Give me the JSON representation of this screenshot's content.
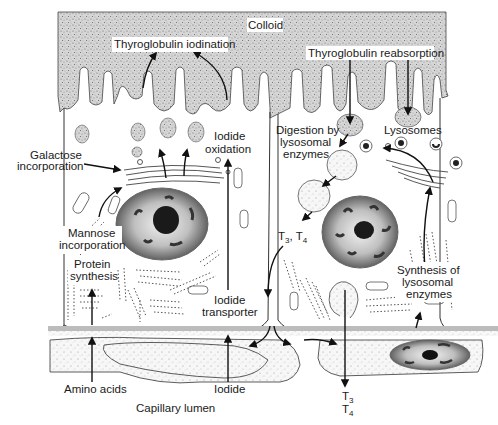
{
  "diagram": {
    "regions": {
      "colloid": "Colloid",
      "capillary": "Capillary lumen"
    },
    "left_cell_labels": {
      "thyroglobulin_iodination": "Thyroglobulin iodination",
      "iodide_oxidation_1": "Iodide",
      "iodide_oxidation_2": "oxidation",
      "galactose_1": "Galactose",
      "galactose_2": "incorporation",
      "mannose_1": "Mannose",
      "mannose_2": "incorporation",
      "protein_synthesis_1": "Protein",
      "protein_synthesis_2": "synthesis",
      "iodide_transporter_1": "Iodide",
      "iodide_transporter_2": "transporter",
      "amino_acids": "Amino acids",
      "iodide": "Iodide"
    },
    "right_cell_labels": {
      "thyroglobulin_reabsorption": "Thyroglobulin reabsorption",
      "digestion_1": "Digestion by",
      "digestion_2": "lysosomal",
      "digestion_3": "enzymes",
      "lysosomes": "Lysosomes",
      "t3_t4_cell": "T",
      "t3_sub": "3",
      "t4_prefix": ", T",
      "t4_sub": "4",
      "synthesis_1": "Synthesis of",
      "synthesis_2": "lysosomal",
      "synthesis_3": "enzymes",
      "t3_out": "T",
      "t3_out_sub": "3",
      "t4_out": "T",
      "t4_out_sub": "4"
    },
    "colors": {
      "stipple": "#bdbdbd",
      "basement_membrane": "#b8b8b8",
      "line": "#333333",
      "nucleolus": "#1a1a1a"
    }
  }
}
